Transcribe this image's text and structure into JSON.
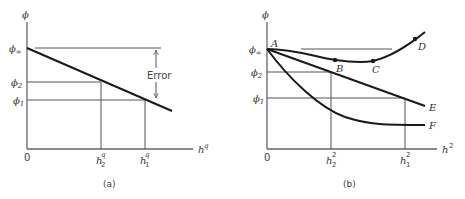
{
  "panels": {
    "a": {
      "caption": "(a)",
      "y_axis_label": "ϕ",
      "x_axis_label_base": "h",
      "x_axis_label_sup": "q",
      "origin_label": "0",
      "y_ticks": [
        {
          "base": "ϕ",
          "sub": "∞"
        },
        {
          "base": "ϕ",
          "sub": "2"
        },
        {
          "base": "ϕ",
          "sub": "1"
        }
      ],
      "x_ticks": [
        {
          "base": "h",
          "sub": "2",
          "sup": "q"
        },
        {
          "base": "h",
          "sub": "1",
          "sup": "q"
        }
      ],
      "annotation": "Error"
    },
    "b": {
      "caption": "(b)",
      "y_axis_label": "ϕ",
      "x_axis_label_base": "h",
      "x_axis_label_sup": "2",
      "origin_label": "0",
      "y_ticks": [
        {
          "base": "ϕ",
          "sub": "∞"
        },
        {
          "base": "ϕ",
          "sub": "2"
        },
        {
          "base": "ϕ",
          "sub": "1"
        }
      ],
      "x_ticks": [
        {
          "base": "h",
          "sub": "2",
          "sup": "2"
        },
        {
          "base": "h",
          "sub": "1",
          "sup": "2"
        }
      ],
      "point_labels": [
        "A",
        "B",
        "C",
        "D"
      ],
      "curve_labels": [
        "E",
        "F"
      ]
    }
  },
  "colors": {
    "axis": "#666666",
    "curve": "#1a1a1a",
    "guide": "#555555",
    "text": "#444444"
  }
}
